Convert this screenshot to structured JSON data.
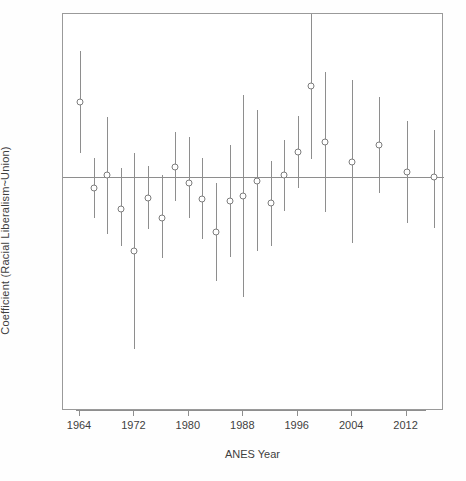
{
  "chart_data": {
    "type": "scatter",
    "title": "",
    "xlabel": "ANES Year",
    "ylabel": "Coefficient (Racial Liberalism~Union)",
    "grid": false,
    "legend": "none",
    "x_tick_labels": [
      "1964",
      "1972",
      "1980",
      "1988",
      "1996",
      "2004",
      "2012"
    ],
    "x_tick_values": [
      1964,
      1972,
      1980,
      1988,
      1996,
      2004,
      2012
    ],
    "xlim": [
      1961.5,
      2017.5
    ],
    "ylim": [
      -0.72,
      0.5
    ],
    "y_axis_ticks_shown": false,
    "zero_reference_line": 0,
    "marker": "open-circle",
    "error_bar_style": "vertical-line-95ci",
    "series": [
      {
        "name": "Coefficient (Racial Liberalism~Union)",
        "x": [
          1964,
          1966,
          1968,
          1970,
          1972,
          1974,
          1976,
          1978,
          1980,
          1982,
          1984,
          1986,
          1988,
          1990,
          1992,
          1994,
          1996,
          1998,
          2000,
          2004,
          2008,
          2012,
          2016
        ],
        "values": [
          0.23,
          -0.036,
          0.004,
          -0.1,
          -0.228,
          -0.066,
          -0.128,
          0.03,
          -0.018,
          -0.068,
          -0.17,
          -0.074,
          -0.06,
          -0.012,
          -0.082,
          0.004,
          0.076,
          0.28,
          0.106,
          0.046,
          0.098,
          0.014,
          0.0
        ],
        "ci_low": [
          0.074,
          -0.128,
          -0.176,
          -0.214,
          -0.528,
          -0.162,
          -0.25,
          -0.076,
          -0.126,
          -0.192,
          -0.322,
          -0.248,
          -0.37,
          -0.228,
          -0.212,
          -0.104,
          -0.036,
          0.054,
          -0.11,
          -0.204,
          -0.05,
          -0.142,
          -0.158
        ],
        "ci_high": [
          0.386,
          0.056,
          0.184,
          0.026,
          0.072,
          0.032,
          0.006,
          0.136,
          0.122,
          0.056,
          -0.018,
          0.098,
          0.25,
          0.204,
          0.048,
          0.112,
          0.188,
          0.5,
          0.322,
          0.296,
          0.246,
          0.17,
          0.142
        ]
      }
    ]
  },
  "axes": {
    "x_title": "ANES Year",
    "y_title": "Coefficient (Racial Liberalism~Union)"
  }
}
